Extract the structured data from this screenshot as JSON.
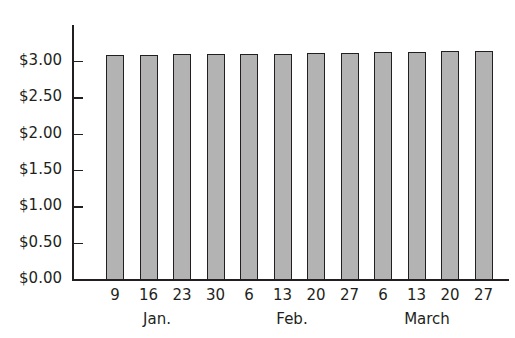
{
  "chart_data": {
    "type": "bar",
    "title": "",
    "xlabel": "",
    "ylabel": "",
    "categories": [
      "9",
      "16",
      "23",
      "30",
      "6",
      "13",
      "20",
      "27",
      "6",
      "13",
      "20",
      "27"
    ],
    "month_groups": [
      {
        "label": "Jan.",
        "categories": [
          "9",
          "16",
          "23",
          "30"
        ]
      },
      {
        "label": "Feb.",
        "categories": [
          "6",
          "13",
          "20",
          "27"
        ]
      },
      {
        "label": "March",
        "categories": [
          "6",
          "13",
          "20",
          "27"
        ]
      }
    ],
    "values": [
      3.08,
      3.08,
      3.09,
      3.09,
      3.09,
      3.1,
      3.11,
      3.11,
      3.12,
      3.12,
      3.13,
      3.14
    ],
    "ylim": [
      0,
      3.5
    ],
    "yticks": [
      0,
      0.5,
      1.0,
      1.5,
      2.0,
      2.5,
      3.0
    ],
    "ytick_labels": [
      "$0.00",
      "$0.50",
      "$1.00",
      "$1.50",
      "$2.00",
      "$2.50",
      "$3.00"
    ],
    "grid": false,
    "legend": null,
    "bar_color": "#b3b3b3",
    "edge_color": "#231f20"
  },
  "labels": {
    "months": [
      "Jan.",
      "Feb.",
      "March"
    ]
  }
}
